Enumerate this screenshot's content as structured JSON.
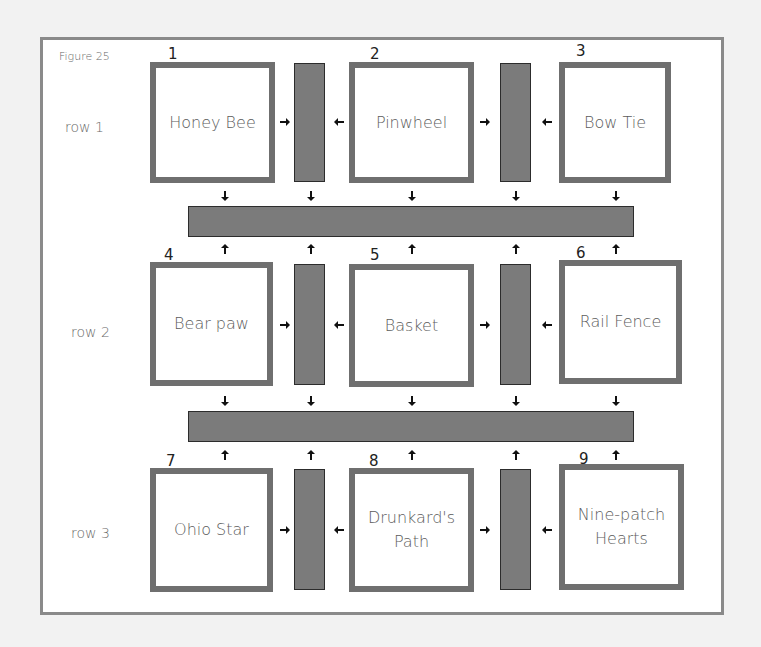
{
  "figure": {
    "title": "Figure 25",
    "colors": {
      "page_background": "#f2f2f2",
      "frame_border": "#8a8a8a",
      "block_border": "#6f6f6f",
      "sashing_fill": "#7b7b7b",
      "sashing_outline": "#2c2c2c",
      "arrow": "#111111",
      "text": "#5c5c5c"
    }
  },
  "rows": [
    {
      "label": "row 1"
    },
    {
      "label": "row 2"
    },
    {
      "label": "row 3"
    }
  ],
  "blocks": [
    {
      "number": "1",
      "name": "Honey Bee",
      "row": 1,
      "col": 1
    },
    {
      "number": "2",
      "name": "Pinwheel",
      "row": 1,
      "col": 2
    },
    {
      "number": "3",
      "name": "Bow Tie",
      "row": 1,
      "col": 3
    },
    {
      "number": "4",
      "name": "Bear paw",
      "row": 2,
      "col": 1
    },
    {
      "number": "5",
      "name": "Basket",
      "row": 2,
      "col": 2
    },
    {
      "number": "6",
      "name": "Rail Fence",
      "row": 2,
      "col": 3
    },
    {
      "number": "7",
      "name": "Ohio Star",
      "row": 3,
      "col": 1
    },
    {
      "number": "8",
      "name": "Drunkard's\nPath",
      "row": 3,
      "col": 2
    },
    {
      "number": "9",
      "name": "Nine-patch\nHearts",
      "row": 3,
      "col": 3
    }
  ],
  "sashing": {
    "vertical_count_per_row": 2,
    "horizontal_count": 2,
    "arrow_icon": "arrow-icon"
  }
}
